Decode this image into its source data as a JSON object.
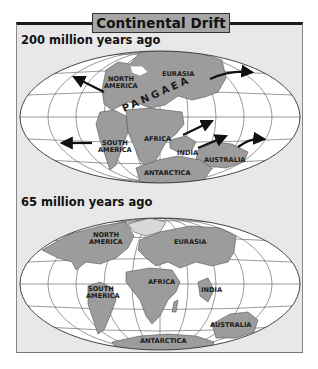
{
  "title": "Continental Drift",
  "colors": {
    "frame_bg": "#e8e8e8",
    "title_box": "#a6a6a6",
    "land": "#9c9c9c",
    "ocean": "#ffffff",
    "grid": "#555555",
    "arrow": "#111111"
  },
  "maps": [
    {
      "era": "200 million years ago",
      "supercontinent": "PANGAEA",
      "labels": {
        "north_america": [
          "NORTH",
          "AMERICA"
        ],
        "eurasia": "EURASIA",
        "south_america": [
          "SOUTH",
          "AMERICA"
        ],
        "africa": "AFRICA",
        "india": "INDIA",
        "australia": "AUSTRALIA",
        "antarctica": "ANTARCTICA"
      },
      "arrows": [
        "north-america-northwest",
        "eurasia-east",
        "south-america-west",
        "africa-northeast",
        "india-northeast",
        "australia-northeast"
      ]
    },
    {
      "era": "65 million years ago",
      "labels": {
        "north_america": [
          "NORTH",
          "AMERICA"
        ],
        "eurasia": "EURASIA",
        "south_america": [
          "SOUTH",
          "AMERICA"
        ],
        "africa": "AFRICA",
        "india": "INDIA",
        "australia": "AUSTRALIA",
        "antarctica": "ANTARCTICA"
      }
    }
  ]
}
